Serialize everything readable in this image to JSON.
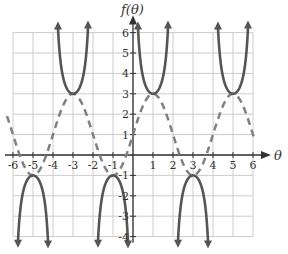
{
  "chart_data": {
    "type": "line",
    "title": "",
    "xlabel": "θ",
    "ylabel": "f(θ)",
    "xlim": [
      -6,
      6
    ],
    "ylim": [
      -4,
      6
    ],
    "grid": true,
    "x_ticks": [
      -6,
      -5,
      -4,
      -3,
      -2,
      -1,
      1,
      2,
      3,
      4,
      5,
      6
    ],
    "y_ticks": [
      -4,
      -3,
      -2,
      -1,
      1,
      2,
      3,
      4,
      5,
      6
    ],
    "x_tick_labels": [
      "-6",
      "-5",
      "-4",
      "-3",
      "-2",
      "-1",
      "1",
      "2",
      "3",
      "4",
      "5",
      "6"
    ],
    "y_tick_labels": [
      "-4",
      "-3",
      "-2",
      "-1",
      "1",
      "2",
      "3",
      "4",
      "5",
      "6"
    ],
    "series": [
      {
        "name": "f(θ) = 1 + 2csc(πθ/2)",
        "style": "solid",
        "color": "#555555",
        "asymptotes": [
          -6,
          -4,
          -2,
          0,
          2,
          4,
          6
        ],
        "local_min_points": [
          [
            -3,
            3
          ],
          [
            1,
            3
          ],
          [
            5,
            3
          ]
        ],
        "local_max_points": [
          [
            -5,
            -1
          ],
          [
            -1,
            -1
          ],
          [
            3,
            -1
          ]
        ]
      },
      {
        "name": "y = 1 + 2sin(πθ/2)",
        "style": "dashed",
        "color": "#777777",
        "x": [
          -6,
          -5,
          -4,
          -3,
          -2,
          -1,
          0,
          1,
          2,
          3,
          4,
          5,
          6
        ],
        "values": [
          1,
          -1,
          1,
          3,
          1,
          -1,
          1,
          3,
          1,
          -1,
          1,
          3,
          1
        ]
      }
    ]
  },
  "colors": {
    "grid": "#cccccc",
    "axis": "#333333",
    "curve": "#555555",
    "dashed": "#808080"
  }
}
